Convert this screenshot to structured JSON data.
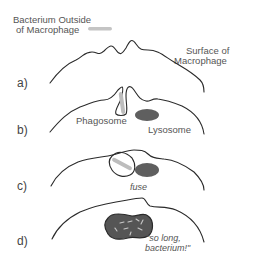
{
  "title_labels": {
    "bacterium_outside_line1": "Bacterium Outside",
    "bacterium_outside_line2": "of Macrophage",
    "surface_line1": "Surface of",
    "surface_line2": "Macrophage"
  },
  "steps": [
    {
      "label": "a)"
    },
    {
      "label": "b)",
      "phagosome": "Phagosome",
      "lysosome": "Lysosome"
    },
    {
      "label": "c)",
      "caption": "fuse"
    },
    {
      "label": "d)",
      "caption_line1": "\"so long,",
      "caption_line2": "bacterium!\""
    }
  ],
  "colors": {
    "membrane": "#2a2a2a",
    "bacterium": "#bdbdbd",
    "lysosome": "#5f5f5f",
    "text": "#555555"
  }
}
